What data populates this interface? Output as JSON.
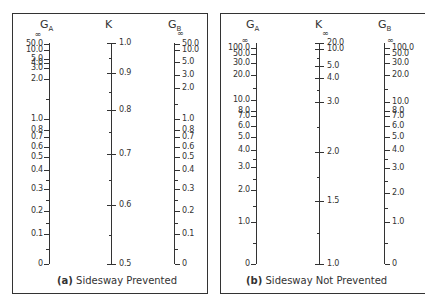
{
  "chart_data": [
    {
      "type": "nomograph",
      "panel": "a",
      "caption_tag": "(a)",
      "caption": "Sidesway Prevented",
      "axes": [
        {
          "name": "GA",
          "title_main": "G",
          "title_sub": "A",
          "label_side": "left",
          "labels": [
            "∞",
            "50.0",
            "10.0",
            "5.0",
            "4.0",
            "3.0",
            "2.0",
            "1.0",
            "0.8",
            "0.7",
            "0.6",
            "0.5",
            "0.4",
            "0.3",
            "0.2",
            "0.1",
            "0"
          ]
        },
        {
          "name": "K",
          "title_main": "K",
          "title_sub": "",
          "label_side": "right",
          "labels": [
            "1.0",
            "0.9",
            "0.8",
            "0.7",
            "0.6",
            "0.5"
          ]
        },
        {
          "name": "GB",
          "title_main": "G",
          "title_sub": "B",
          "label_side": "right",
          "labels": [
            "∞",
            "50.0",
            "10.0",
            "5.0",
            "3.0",
            "2.0",
            "1.0",
            "0.8",
            "0.7",
            "0.6",
            "0.5",
            "0.4",
            "0.3",
            "0.2",
            "0.1",
            "0"
          ]
        }
      ]
    },
    {
      "type": "nomograph",
      "panel": "b",
      "caption_tag": "(b)",
      "caption": "Sidesway Not Prevented",
      "axes": [
        {
          "name": "GA",
          "title_main": "G",
          "title_sub": "A",
          "label_side": "left",
          "labels": [
            "∞",
            "100.0",
            "50.0",
            "30.0",
            "20.0",
            "10.0",
            "8.0",
            "7.0",
            "6.0",
            "5.0",
            "4.0",
            "3.0",
            "2.0",
            "1.0",
            "0"
          ]
        },
        {
          "name": "K",
          "title_main": "K",
          "title_sub": "",
          "label_side": "right",
          "labels": [
            "∞",
            "20.0",
            "10.0",
            "5.0",
            "4.0",
            "3.0",
            "2.0",
            "1.5",
            "1.0"
          ]
        },
        {
          "name": "GB",
          "title_main": "G",
          "title_sub": "B",
          "label_side": "right",
          "labels": [
            "∞",
            "100.0",
            "50.0",
            "30.0",
            "20.0",
            "10.0",
            "8.0",
            "7.0",
            "6.0",
            "5.0",
            "4.0",
            "3.0",
            "2.0",
            "1.0",
            "0"
          ]
        }
      ]
    }
  ],
  "panels": {
    "a": {
      "caption_tag": "(a)",
      "caption": "Sidesway Prevented",
      "ga_title": "G",
      "ga_sub": "A",
      "k_title": "K",
      "gb_title": "G",
      "gb_sub": "B"
    },
    "b": {
      "caption_tag": "(b)",
      "caption": "Sidesway Not Prevented",
      "ga_title": "G",
      "ga_sub": "A",
      "k_title": "K",
      "gb_title": "G",
      "gb_sub": "B"
    }
  },
  "layout": {
    "a": {
      "ga": {
        "x": 49,
        "side": "left",
        "ticks": [
          {
            "y": 36,
            "t": "∞"
          },
          {
            "y": 44,
            "t": "50.0"
          },
          {
            "y": 50,
            "t": "10.0"
          },
          {
            "y": 59,
            "t": "5.0"
          },
          {
            "y": 63,
            "t": "4.0"
          },
          {
            "y": 68,
            "t": "3.0"
          },
          {
            "y": 79,
            "t": "2.0"
          },
          {
            "y": 119,
            "t": "1.0"
          },
          {
            "y": 130,
            "t": "0.8"
          },
          {
            "y": 137,
            "t": "0.7"
          },
          {
            "y": 147,
            "t": "0.6"
          },
          {
            "y": 157,
            "t": "0.5"
          },
          {
            "y": 170,
            "t": "0.4"
          },
          {
            "y": 189,
            "t": "0.3"
          },
          {
            "y": 211,
            "t": "0.2"
          },
          {
            "y": 234,
            "t": "0.1"
          },
          {
            "y": 264,
            "t": "0"
          }
        ]
      },
      "k": {
        "x": 111,
        "side": "right",
        "ticks": [
          {
            "y": 43,
            "t": "1.0"
          },
          {
            "y": 73,
            "t": "0.9"
          },
          {
            "y": 110,
            "t": "0.8"
          },
          {
            "y": 154,
            "t": "0.7"
          },
          {
            "y": 205,
            "t": "0.6"
          },
          {
            "y": 264,
            "t": "0.5"
          }
        ]
      },
      "gb": {
        "x": 174,
        "side": "right",
        "ticks": [
          {
            "y": 35,
            "t": "∞"
          },
          {
            "y": 44,
            "t": "50.0"
          },
          {
            "y": 50,
            "t": "10.0"
          },
          {
            "y": 62,
            "t": "5.0"
          },
          {
            "y": 75,
            "t": "3.0"
          },
          {
            "y": 88,
            "t": "2.0"
          },
          {
            "y": 119,
            "t": "1.0"
          },
          {
            "y": 130,
            "t": "0.8"
          },
          {
            "y": 137,
            "t": "0.7"
          },
          {
            "y": 147,
            "t": "0.6"
          },
          {
            "y": 157,
            "t": "0.5"
          },
          {
            "y": 170,
            "t": "0.4"
          },
          {
            "y": 189,
            "t": "0.3"
          },
          {
            "y": 211,
            "t": "0.2"
          },
          {
            "y": 234,
            "t": "0.1"
          },
          {
            "y": 264,
            "t": "0"
          }
        ]
      }
    },
    "b": {
      "ga": {
        "x": 256,
        "side": "left",
        "ticks": [
          {
            "y": 42,
            "t": "∞"
          },
          {
            "y": 48,
            "t": "100.0"
          },
          {
            "y": 54,
            "t": "50.0"
          },
          {
            "y": 63,
            "t": "30.0"
          },
          {
            "y": 75,
            "t": "20.0"
          },
          {
            "y": 100,
            "t": "10.0"
          },
          {
            "y": 111,
            "t": "8.0"
          },
          {
            "y": 116,
            "t": "7.0"
          },
          {
            "y": 126,
            "t": "6.0"
          },
          {
            "y": 137,
            "t": "5.0"
          },
          {
            "y": 150,
            "t": "4.0"
          },
          {
            "y": 167,
            "t": "3.0"
          },
          {
            "y": 190,
            "t": "2.0"
          },
          {
            "y": 222,
            "t": "1.0"
          },
          {
            "y": 264,
            "t": "0"
          }
        ]
      },
      "k": {
        "x": 319,
        "side": "right",
        "ticks": [
          {
            "y": 35,
            "t": "∞"
          },
          {
            "y": 43,
            "t": "20.0"
          },
          {
            "y": 49,
            "t": "10.0"
          },
          {
            "y": 66,
            "t": "5.0"
          },
          {
            "y": 78,
            "t": "4.0"
          },
          {
            "y": 102,
            "t": "3.0"
          },
          {
            "y": 152,
            "t": "2.0"
          },
          {
            "y": 201,
            "t": "1.5"
          },
          {
            "y": 264,
            "t": "1.0"
          }
        ]
      },
      "gb": {
        "x": 384,
        "side": "right",
        "ticks": [
          {
            "y": 42,
            "t": "∞"
          },
          {
            "y": 48,
            "t": "100.0"
          },
          {
            "y": 54,
            "t": "50.0"
          },
          {
            "y": 63,
            "t": "30.0"
          },
          {
            "y": 75,
            "t": "20.0"
          },
          {
            "y": 102,
            "t": "10.0"
          },
          {
            "y": 111,
            "t": "8.0"
          },
          {
            "y": 116,
            "t": "7.0"
          },
          {
            "y": 126,
            "t": "6.0"
          },
          {
            "y": 137,
            "t": "5.0"
          },
          {
            "y": 150,
            "t": "4.0"
          },
          {
            "y": 168,
            "t": "3.0"
          },
          {
            "y": 193,
            "t": "2.0"
          },
          {
            "y": 222,
            "t": "1.0"
          },
          {
            "y": 264,
            "t": "0"
          }
        ]
      }
    }
  }
}
